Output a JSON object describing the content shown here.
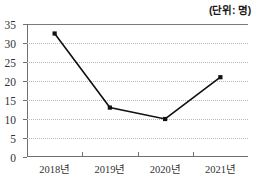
{
  "clipped_left_text": ")",
  "unit_note": "(단위: 명)",
  "chart_data": {
    "type": "line",
    "title": "",
    "subtitle": "",
    "xlabel": "",
    "ylabel": "",
    "unit": "명",
    "categories": [
      "2018년",
      "2019년",
      "2020년",
      "2021년"
    ],
    "values": [
      32.5,
      13,
      10,
      21
    ],
    "series": [
      {
        "name": "",
        "values": [
          32.5,
          13,
          10,
          21
        ],
        "color": "#111111",
        "marker": "square",
        "marker_color": "#111111"
      }
    ],
    "ylim": [
      0,
      35
    ],
    "ytick_labels": [
      "0",
      "5",
      "10",
      "15",
      "20",
      "25",
      "30",
      "35"
    ],
    "yticks": [
      0,
      5,
      10,
      15,
      20,
      25,
      30,
      35
    ],
    "grid": true,
    "grid_style": "dotted",
    "grid_color": "#b9b9b9",
    "legend": false,
    "legend_position": "none",
    "axis_color": "#6f6f6f"
  }
}
